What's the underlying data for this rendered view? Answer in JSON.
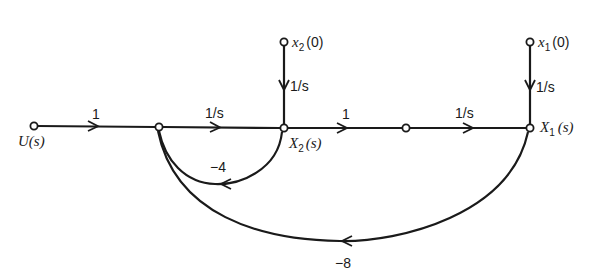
{
  "diagram": {
    "type": "signal-flow-graph",
    "nodes": {
      "input": "U(s)",
      "x2_initial": {
        "var": "x",
        "sub": "2",
        "arg": "(0)"
      },
      "x1_initial": {
        "var": "x",
        "sub": "1",
        "arg": "(0)"
      },
      "X2": {
        "var": "X",
        "sub": "2",
        "arg": "(s)"
      },
      "X1": {
        "var": "X",
        "sub": "1",
        "arg": "(s)"
      }
    },
    "branches": {
      "u_to_a": "1",
      "a_to_x2": "1/s",
      "x2init_to_x2": "1/s",
      "x2_to_m": "1",
      "m_to_x1": "1/s",
      "x1init_to_x1": "1/s",
      "x2_to_a_feedback": "−4",
      "x1_to_a_feedback": "−8"
    }
  }
}
